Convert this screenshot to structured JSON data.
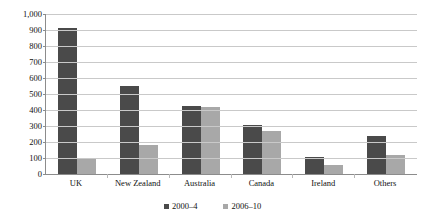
{
  "chart_data": {
    "type": "bar",
    "title": "",
    "xlabel": "",
    "ylabel": "Number of advertisements",
    "categories": [
      "UK",
      "New Zealand",
      "Australia",
      "Canada",
      "Ireland",
      "Others"
    ],
    "series": [
      {
        "name": "2000–4",
        "color": "#4a4a4a",
        "values": [
          910,
          550,
          425,
          305,
          105,
          235
        ]
      },
      {
        "name": "2006–10",
        "color": "#a8a8a8",
        "values": [
          100,
          180,
          420,
          270,
          55,
          120
        ]
      }
    ],
    "ylim": [
      0,
      1000
    ],
    "yticks": [
      "0",
      "100",
      "200",
      "300",
      "400",
      "500",
      "600",
      "700",
      "800",
      "900",
      "1,000"
    ],
    "ytick_values": [
      0,
      100,
      200,
      300,
      400,
      500,
      600,
      700,
      800,
      900,
      1000
    ],
    "grid": true,
    "legend_position": "bottom"
  },
  "colors": {
    "series_dark": "#4a4a4a",
    "series_light": "#a8a8a8",
    "gridline": "#c9c9c9",
    "axis": "#8c8c8c",
    "background": "#ffffff"
  }
}
